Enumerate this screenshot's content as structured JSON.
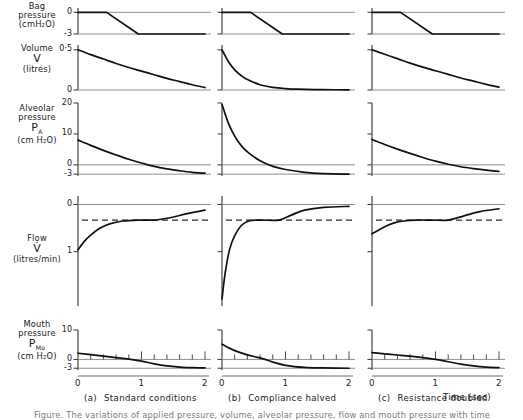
{
  "figure": {
    "time_axis_label": "Time (sec)",
    "caption_partial": "Figure. The variations of applied pressure, volume, alveolar pressure, flow and mouth pressure with time",
    "columns": [
      {
        "tag": "(a)",
        "label": "Standard conditions"
      },
      {
        "tag": "(b)",
        "label": "Compliance halved"
      },
      {
        "tag": "(c)",
        "label": "Resistance doubled"
      }
    ],
    "rows": [
      {
        "name": "bag-pressure",
        "title_lines": [
          "Bag",
          "pressure"
        ],
        "symbol": "",
        "units": "(cmH₂O)",
        "yticks": [
          {
            "value": 0,
            "label": "0"
          },
          {
            "value": -3,
            "label": "-3"
          }
        ],
        "ylim": [
          -3,
          0.6
        ]
      },
      {
        "name": "volume",
        "title_lines": [
          "Volume"
        ],
        "symbol": "V",
        "units": "(litres)",
        "yticks": [
          {
            "value": 0.5,
            "label": "0·5"
          },
          {
            "value": 0,
            "label": "0"
          }
        ],
        "ylim": [
          0,
          0.56
        ]
      },
      {
        "name": "alveolar-pressure",
        "title_lines": [
          "Alveolar",
          "pressure"
        ],
        "symbol": "P",
        "symbol_sub": "A",
        "units": "(cm H₂O)",
        "yticks": [
          {
            "value": 20,
            "label": "20"
          },
          {
            "value": 10,
            "label": "10"
          },
          {
            "value": 0,
            "label": "0"
          },
          {
            "value": -3,
            "label": "-3"
          }
        ],
        "ylim": [
          -3.6,
          20
        ]
      },
      {
        "name": "flow",
        "title_lines": [
          "Flow"
        ],
        "symbol": "V̇",
        "units": "(litres/min)",
        "yticks": [
          {
            "value": 0,
            "label": "0"
          },
          {
            "value": -1,
            "label": "1"
          }
        ],
        "ylim": [
          -2.15,
          0.18
        ]
      },
      {
        "name": "mouth-pressure",
        "title_lines": [
          "Mouth",
          "pressure"
        ],
        "symbol": "P",
        "symbol_sub": "Mo",
        "units": "(cm H₂O)",
        "yticks": [
          {
            "value": 10,
            "label": "10"
          },
          {
            "value": 0,
            "label": "0"
          },
          {
            "value": -3,
            "label": "-3"
          }
        ],
        "ylim": [
          -3.6,
          10
        ]
      }
    ],
    "xticks": [
      {
        "value": 0,
        "label": "0"
      },
      {
        "value": 1,
        "label": "1"
      },
      {
        "value": 2,
        "label": "2"
      }
    ],
    "xlim": [
      0,
      2
    ]
  },
  "chart_data": {
    "type": "line",
    "xlabel": "Time (sec)",
    "xlim": [
      0,
      2
    ],
    "x_tick_labels": [
      "0",
      "1",
      "2"
    ],
    "grid": false,
    "legend": "none",
    "panels": [
      {
        "row": "Bag pressure (cmH2O)",
        "column": "(a) Standard conditions",
        "ylabel": "Bag pressure",
        "yunits": "cmH2O",
        "ylim": [
          -3,
          0.6
        ],
        "y_tick_labels": [
          "0",
          "-3"
        ],
        "x": [
          0.0,
          0.45,
          0.95,
          2.0
        ],
        "y": [
          0.0,
          0.0,
          -3.0,
          -3.0
        ]
      },
      {
        "row": "Bag pressure (cmH2O)",
        "column": "(b) Compliance halved",
        "ylabel": "Bag pressure",
        "yunits": "cmH2O",
        "ylim": [
          -3,
          0.6
        ],
        "y_tick_labels": [
          "0",
          "-3"
        ],
        "x": [
          0.0,
          0.45,
          0.95,
          2.0
        ],
        "y": [
          0.0,
          0.0,
          -3.0,
          -3.0
        ]
      },
      {
        "row": "Bag pressure (cmH2O)",
        "column": "(c) Resistance doubled",
        "ylabel": "Bag pressure",
        "yunits": "cmH2O",
        "ylim": [
          -3,
          0.6
        ],
        "y_tick_labels": [
          "0",
          "-3"
        ],
        "x": [
          0.0,
          0.45,
          0.95,
          2.0
        ],
        "y": [
          0.0,
          0.0,
          -3.0,
          -3.0
        ]
      },
      {
        "row": "Volume V (litres)",
        "column": "(a) Standard conditions",
        "ylabel": "Volume V",
        "yunits": "litres",
        "ylim": [
          0,
          0.56
        ],
        "y_tick_labels": [
          "0·5",
          "0"
        ],
        "x": [
          0.0,
          0.2,
          0.4,
          0.6,
          0.8,
          1.0,
          1.2,
          1.4,
          1.6,
          1.8,
          2.0
        ],
        "y": [
          0.5,
          0.44,
          0.385,
          0.33,
          0.28,
          0.235,
          0.19,
          0.145,
          0.105,
          0.065,
          0.03
        ]
      },
      {
        "row": "Volume V (litres)",
        "column": "(b) Compliance halved",
        "ylabel": "Volume V",
        "yunits": "litres",
        "ylim": [
          0,
          0.56
        ],
        "y_tick_labels": [
          "0·5",
          "0"
        ],
        "x": [
          0.0,
          0.1,
          0.2,
          0.3,
          0.4,
          0.6,
          0.8,
          1.0,
          1.2,
          1.6,
          2.0
        ],
        "y": [
          0.5,
          0.355,
          0.25,
          0.18,
          0.13,
          0.065,
          0.033,
          0.018,
          0.01,
          0.004,
          0.002
        ]
      },
      {
        "row": "Volume V (litres)",
        "column": "(c) Resistance doubled",
        "ylabel": "Volume V",
        "yunits": "litres",
        "ylim": [
          0,
          0.56
        ],
        "y_tick_labels": [
          "0·5",
          "0"
        ],
        "x": [
          0.0,
          0.2,
          0.4,
          0.6,
          0.8,
          1.0,
          1.2,
          1.4,
          1.6,
          1.8,
          2.0
        ],
        "y": [
          0.5,
          0.445,
          0.39,
          0.335,
          0.285,
          0.24,
          0.195,
          0.15,
          0.11,
          0.07,
          0.035
        ]
      },
      {
        "row": "Alveolar pressure PA (cm H2O)",
        "column": "(a) Standard conditions",
        "ylabel": "Alveolar pressure PA",
        "yunits": "cm H2O",
        "ylim": [
          -3.6,
          20
        ],
        "y_tick_labels": [
          "20",
          "10",
          "0",
          "-3"
        ],
        "x": [
          0.0,
          0.2,
          0.4,
          0.6,
          0.8,
          1.0,
          1.2,
          1.4,
          1.6,
          1.8,
          2.0
        ],
        "y": [
          8.0,
          6.3,
          4.7,
          3.2,
          1.8,
          0.6,
          -0.5,
          -1.3,
          -1.9,
          -2.4,
          -2.7
        ]
      },
      {
        "row": "Alveolar pressure PA (cm H2O)",
        "column": "(b) Compliance halved",
        "ylabel": "Alveolar pressure PA",
        "yunits": "cm H2O",
        "ylim": [
          -3.6,
          20
        ],
        "y_tick_labels": [
          "20",
          "10",
          "0",
          "-3"
        ],
        "x": [
          0.0,
          0.1,
          0.2,
          0.3,
          0.4,
          0.6,
          0.8,
          1.0,
          1.3,
          1.6,
          2.0
        ],
        "y": [
          19.5,
          13.5,
          9.3,
          6.3,
          4.2,
          1.3,
          -0.5,
          -1.5,
          -2.4,
          -2.8,
          -3.0
        ]
      },
      {
        "row": "Alveolar pressure PA (cm H2O)",
        "column": "(c) Resistance doubled",
        "ylabel": "Alveolar pressure PA",
        "yunits": "cm H2O",
        "ylim": [
          -3.6,
          20
        ],
        "y_tick_labels": [
          "20",
          "10",
          "0",
          "-3"
        ],
        "x": [
          0.0,
          0.2,
          0.4,
          0.6,
          0.8,
          1.0,
          1.2,
          1.4,
          1.6,
          1.8,
          2.0
        ],
        "y": [
          8.2,
          6.6,
          5.1,
          3.7,
          2.4,
          1.2,
          0.2,
          -0.6,
          -1.2,
          -1.7,
          -2.1
        ]
      },
      {
        "row": "Flow V̇ (litres/min)",
        "column": "(a) Standard conditions",
        "ylabel": "Flow",
        "yunits": "litres/min",
        "ylim": [
          -2.15,
          0.18
        ],
        "y_tick_labels": [
          "0",
          "1"
        ],
        "note": "dashed reference line at flow = -0.33",
        "x": [
          0.0,
          0.1,
          0.2,
          0.35,
          0.5,
          0.7,
          0.95,
          1.2,
          1.45,
          1.7,
          2.0
        ],
        "y": [
          -0.96,
          -0.78,
          -0.65,
          -0.5,
          -0.41,
          -0.35,
          -0.33,
          -0.33,
          -0.28,
          -0.2,
          -0.12
        ]
      },
      {
        "row": "Flow V̇ (litres/min)",
        "column": "(b) Compliance halved",
        "ylabel": "Flow",
        "yunits": "litres/min",
        "ylim": [
          -2.15,
          0.18
        ],
        "y_tick_labels": [
          "0",
          "1"
        ],
        "note": "dashed reference line at flow = -0.33",
        "x": [
          0.0,
          0.05,
          0.12,
          0.2,
          0.3,
          0.42,
          0.6,
          0.9,
          1.1,
          1.3,
          1.6,
          2.0
        ],
        "y": [
          -2.0,
          -1.45,
          -0.95,
          -0.66,
          -0.45,
          -0.35,
          -0.33,
          -0.33,
          -0.22,
          -0.12,
          -0.06,
          -0.04
        ]
      },
      {
        "row": "Flow V̇ (litres/min)",
        "column": "(c) Resistance doubled",
        "ylabel": "Flow",
        "yunits": "litres/min",
        "ylim": [
          -2.15,
          0.18
        ],
        "y_tick_labels": [
          "0",
          "1"
        ],
        "note": "dashed reference line at flow = -0.33",
        "x": [
          0.0,
          0.08,
          0.2,
          0.35,
          0.5,
          0.7,
          0.95,
          1.2,
          1.45,
          1.7,
          2.0
        ],
        "y": [
          -0.62,
          -0.56,
          -0.47,
          -0.39,
          -0.35,
          -0.33,
          -0.33,
          -0.33,
          -0.24,
          -0.15,
          -0.09
        ]
      },
      {
        "row": "Mouth pressure PMo (cm H2O)",
        "column": "(a) Standard conditions",
        "ylabel": "Mouth pressure PMo",
        "yunits": "cm H2O",
        "ylim": [
          -3.6,
          10
        ],
        "y_tick_labels": [
          "10",
          "0",
          "-3"
        ],
        "x": [
          0.0,
          0.2,
          0.4,
          0.6,
          0.8,
          1.0,
          1.2,
          1.4,
          1.6,
          1.8,
          2.0
        ],
        "y": [
          2.1,
          1.6,
          1.1,
          0.6,
          0.1,
          -0.6,
          -1.5,
          -2.2,
          -2.6,
          -2.8,
          -2.9
        ]
      },
      {
        "row": "Mouth pressure PMo (cm H2O)",
        "column": "(b) Compliance halved",
        "ylabel": "Mouth pressure PMo",
        "yunits": "cm H2O",
        "ylim": [
          -3.6,
          10
        ],
        "y_tick_labels": [
          "10",
          "0",
          "-3"
        ],
        "x": [
          0.0,
          0.1,
          0.2,
          0.35,
          0.5,
          0.65,
          0.8,
          1.0,
          1.3,
          1.6,
          2.0
        ],
        "y": [
          5.2,
          4.0,
          3.0,
          1.9,
          1.0,
          0.2,
          -0.9,
          -2.0,
          -2.7,
          -2.9,
          -3.0
        ]
      },
      {
        "row": "Mouth pressure PMo (cm H2O)",
        "column": "(c) Resistance doubled",
        "ylabel": "Mouth pressure PMo",
        "yunits": "cm H2O",
        "ylim": [
          -3.6,
          10
        ],
        "y_tick_labels": [
          "10",
          "0",
          "-3"
        ],
        "x": [
          0.0,
          0.2,
          0.4,
          0.6,
          0.8,
          1.0,
          1.2,
          1.4,
          1.6,
          1.8,
          2.0
        ],
        "y": [
          2.3,
          1.9,
          1.5,
          1.1,
          0.6,
          0.0,
          -0.8,
          -1.6,
          -2.2,
          -2.6,
          -2.8
        ]
      }
    ]
  }
}
